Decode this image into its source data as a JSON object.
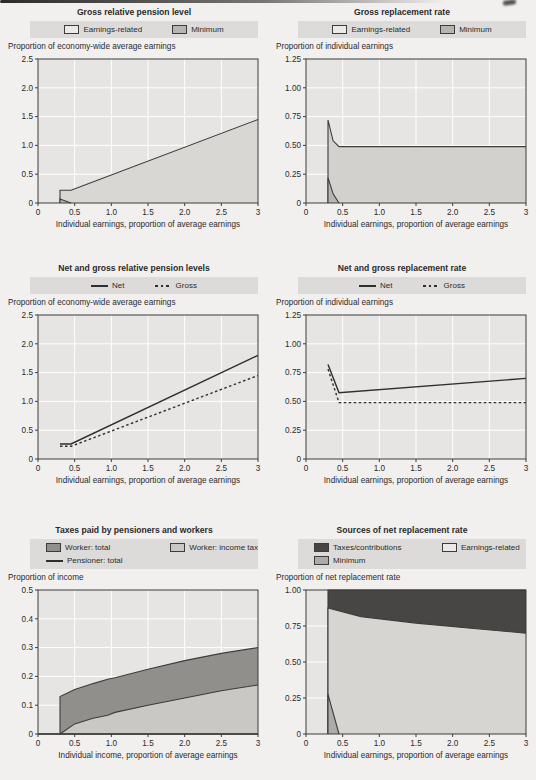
{
  "palette": {
    "page_bg": "#f1f0ee",
    "text": "#2b2b2b",
    "legend_bg": "#dcdbd9",
    "plot_bg": "#e6e5e3",
    "grid": "#ffffff",
    "frame": "#3c3c3c",
    "line": "#2e2e2e"
  },
  "chart_data": [
    {
      "type": "area",
      "title": "Gross relative pension level",
      "unit_label": "Proportion of economy-wide average earnings",
      "xlabel": "Individual earnings, proportion of average earnings",
      "xlim": [
        0,
        3
      ],
      "ylim": [
        0,
        2.5
      ],
      "xtick_vals": [
        0,
        0.5,
        1,
        1.5,
        2,
        2.5,
        3
      ],
      "xtick_labels": [
        "0",
        "0.5",
        "1.0",
        "1.5",
        "2.0",
        "2.5",
        "3"
      ],
      "ytick_vals": [
        0,
        0.5,
        1,
        1.5,
        2,
        2.5
      ],
      "ytick_labels": [
        "0",
        "0.5",
        "1.0",
        "1.5",
        "2.0",
        "2.5"
      ],
      "legend_rows": [
        [
          {
            "swatch": "box",
            "color": "#eceae7",
            "label": "Earnings-related"
          },
          {
            "swatch": "box",
            "color": "#b6b5b2",
            "label": "Minimum"
          }
        ]
      ],
      "series": [
        {
          "name": "Earnings-related",
          "kind": "area",
          "fill": "#d8d7d4",
          "points": [
            [
              0.3,
              0
            ],
            [
              0.3,
              0.22
            ],
            [
              0.45,
              0.22
            ],
            [
              3,
              1.45
            ]
          ]
        },
        {
          "name": "Minimum",
          "kind": "area",
          "fill": "#b6b5b2",
          "points": [
            [
              0.3,
              0
            ],
            [
              0.3,
              0.07
            ],
            [
              0.45,
              0
            ]
          ]
        }
      ]
    },
    {
      "type": "area",
      "title": "Gross replacement rate",
      "unit_label": "Proportion of individual earnings",
      "xlabel": "Individual earnings, proportion of average earnings",
      "xlim": [
        0,
        3
      ],
      "ylim": [
        0,
        1.25
      ],
      "xtick_vals": [
        0,
        0.5,
        1,
        1.5,
        2,
        2.5,
        3
      ],
      "xtick_labels": [
        "0",
        "0.5",
        "1.0",
        "1.5",
        "2.0",
        "2.5",
        "3"
      ],
      "ytick_vals": [
        0,
        0.25,
        0.5,
        0.75,
        1,
        1.25
      ],
      "ytick_labels": [
        "0",
        "0.25",
        "0.50",
        "0.75",
        "1.00",
        "1.25"
      ],
      "legend_rows": [
        [
          {
            "swatch": "box",
            "color": "#eceae7",
            "label": "Earnings-related"
          },
          {
            "swatch": "box",
            "color": "#b6b5b2",
            "label": "Minimum"
          }
        ]
      ],
      "series": [
        {
          "name": "Earnings-related",
          "kind": "area",
          "fill": "#d2d1ce",
          "points": [
            [
              0.3,
              0
            ],
            [
              0.3,
              0.72
            ],
            [
              0.37,
              0.54
            ],
            [
              0.45,
              0.49
            ],
            [
              3,
              0.49
            ]
          ]
        },
        {
          "name": "Minimum",
          "kind": "area",
          "fill": "#b6b5b2",
          "points": [
            [
              0.3,
              0
            ],
            [
              0.3,
              0.22
            ],
            [
              0.37,
              0.08
            ],
            [
              0.45,
              0
            ]
          ]
        }
      ]
    },
    {
      "type": "line",
      "title": "Net and gross relative pension levels",
      "unit_label": "Proportion of economy-wide average earnings",
      "xlabel": "Individual earnings, proportion of average earnings",
      "xlim": [
        0,
        3
      ],
      "ylim": [
        0,
        2.5
      ],
      "xtick_vals": [
        0,
        0.5,
        1,
        1.5,
        2,
        2.5,
        3
      ],
      "xtick_labels": [
        "0",
        "0.5",
        "1.0",
        "1.5",
        "2.0",
        "2.5",
        "3"
      ],
      "ytick_vals": [
        0,
        0.5,
        1,
        1.5,
        2,
        2.5
      ],
      "ytick_labels": [
        "0",
        "0.5",
        "1.0",
        "1.5",
        "2.0",
        "2.5"
      ],
      "legend_rows": [
        [
          {
            "swatch": "line",
            "label": "Net"
          },
          {
            "swatch": "dashed-line",
            "label": "Gross"
          }
        ]
      ],
      "series": [
        {
          "name": "Net",
          "kind": "line",
          "points": [
            [
              0.3,
              0.26
            ],
            [
              0.45,
              0.26
            ],
            [
              3,
              1.8
            ]
          ]
        },
        {
          "name": "Gross",
          "kind": "line",
          "dash": "2.5,2.5",
          "points": [
            [
              0.3,
              0.22
            ],
            [
              0.45,
              0.22
            ],
            [
              3,
              1.45
            ]
          ]
        }
      ]
    },
    {
      "type": "line",
      "title": "Net and gross replacement rate",
      "unit_label": "Proportion of individual earnings",
      "xlabel": "Individual earnings, proportion of average earnings",
      "xlim": [
        0,
        3
      ],
      "ylim": [
        0,
        1.25
      ],
      "xtick_vals": [
        0,
        0.5,
        1,
        1.5,
        2,
        2.5,
        3
      ],
      "xtick_labels": [
        "0",
        "0.5",
        "1.0",
        "1.5",
        "2.0",
        "2.5",
        "3"
      ],
      "ytick_vals": [
        0,
        0.25,
        0.5,
        0.75,
        1,
        1.25
      ],
      "ytick_labels": [
        "0",
        "0.25",
        "0.50",
        "0.75",
        "1.00",
        "1.25"
      ],
      "legend_rows": [
        [
          {
            "swatch": "line",
            "label": "Net"
          },
          {
            "swatch": "dashed-line",
            "label": "Gross"
          }
        ]
      ],
      "series": [
        {
          "name": "Net",
          "kind": "line",
          "points": [
            [
              0.3,
              0.82
            ],
            [
              0.45,
              0.575
            ],
            [
              3,
              0.7
            ]
          ]
        },
        {
          "name": "Gross",
          "kind": "line",
          "dash": "2.5,2.5",
          "points": [
            [
              0.3,
              0.78
            ],
            [
              0.45,
              0.49
            ],
            [
              3,
              0.49
            ]
          ]
        }
      ]
    },
    {
      "type": "area",
      "title": "Taxes paid by pensioners and workers",
      "unit_label": "Proportion of income",
      "xlabel": "Individual income, proportion of average earnings",
      "xlim": [
        0,
        3
      ],
      "ylim": [
        0,
        0.5
      ],
      "xtick_vals": [
        0,
        0.5,
        1,
        1.5,
        2,
        2.5,
        3
      ],
      "xtick_labels": [
        "0",
        "0.5",
        "1.0",
        "1.5",
        "2.0",
        "2.5",
        "3"
      ],
      "ytick_vals": [
        0,
        0.1,
        0.2,
        0.3,
        0.4,
        0.5
      ],
      "ytick_labels": [
        "0",
        "0.1",
        "0.2",
        "0.3",
        "0.4",
        "0.5"
      ],
      "legend_rows": [
        [
          {
            "swatch": "box",
            "color": "#908f8c",
            "label": "Worker: total"
          },
          {
            "swatch": "box",
            "color": "#c9c8c5",
            "label": "Worker: income tax"
          }
        ],
        [
          {
            "swatch": "line",
            "label": "Pensioner: total"
          }
        ]
      ],
      "series": [
        {
          "name": "Worker: total",
          "kind": "area",
          "fill": "#908f8c",
          "points": [
            [
              0.3,
              0
            ],
            [
              0.3,
              0.13
            ],
            [
              0.5,
              0.155
            ],
            [
              0.75,
              0.175
            ],
            [
              0.95,
              0.19
            ],
            [
              1.05,
              0.195
            ],
            [
              1.5,
              0.225
            ],
            [
              2,
              0.255
            ],
            [
              2.5,
              0.28
            ],
            [
              3,
              0.3
            ]
          ]
        },
        {
          "name": "Worker: income tax",
          "kind": "area",
          "fill": "#c9c8c5",
          "points": [
            [
              0.3,
              0
            ],
            [
              0.5,
              0.035
            ],
            [
              0.75,
              0.055
            ],
            [
              0.95,
              0.065
            ],
            [
              1.05,
              0.075
            ],
            [
              1.5,
              0.1
            ],
            [
              2,
              0.125
            ],
            [
              2.5,
              0.15
            ],
            [
              3,
              0.17
            ]
          ]
        },
        {
          "name": "Pensioner: total",
          "kind": "line",
          "points": [
            [
              0,
              0
            ],
            [
              3,
              0
            ]
          ]
        }
      ]
    },
    {
      "type": "area",
      "title": "Sources of net replacement rate",
      "unit_label": "Proportion of net replacement rate",
      "xlabel": "Individual earnings, proportion of average earnings",
      "xlim": [
        0,
        3
      ],
      "ylim": [
        0,
        1
      ],
      "xtick_vals": [
        0,
        0.5,
        1,
        1.5,
        2,
        2.5,
        3
      ],
      "xtick_labels": [
        "0",
        "0.5",
        "1.0",
        "1.5",
        "2.0",
        "2.5",
        "3"
      ],
      "ytick_vals": [
        0,
        0.25,
        0.5,
        0.75,
        1
      ],
      "ytick_labels": [
        "0",
        "0.25",
        "0.50",
        "0.75",
        "1.00"
      ],
      "legend_rows": [
        [
          {
            "swatch": "box",
            "color": "#474645",
            "label": "Taxes/contributions"
          },
          {
            "swatch": "box",
            "color": "#eceae7",
            "label": "Earnings-related"
          }
        ],
        [
          {
            "swatch": "box",
            "color": "#acaba8",
            "label": "Minimum"
          }
        ]
      ],
      "series": [
        {
          "name": "Taxes/contributions",
          "kind": "area",
          "fill": "#474645",
          "points": [
            [
              0.3,
              0
            ],
            [
              0.3,
              1
            ],
            [
              3,
              1
            ]
          ]
        },
        {
          "name": "Earnings-related",
          "kind": "area",
          "fill": "#d6d5d2",
          "points": [
            [
              0.3,
              0
            ],
            [
              0.3,
              0.875
            ],
            [
              0.75,
              0.815
            ],
            [
              1.5,
              0.77
            ],
            [
              2.25,
              0.735
            ],
            [
              3,
              0.7
            ]
          ]
        },
        {
          "name": "Minimum",
          "kind": "area",
          "fill": "#acaba8",
          "points": [
            [
              0.3,
              0
            ],
            [
              0.3,
              0.275
            ],
            [
              0.45,
              0
            ]
          ]
        }
      ]
    }
  ]
}
